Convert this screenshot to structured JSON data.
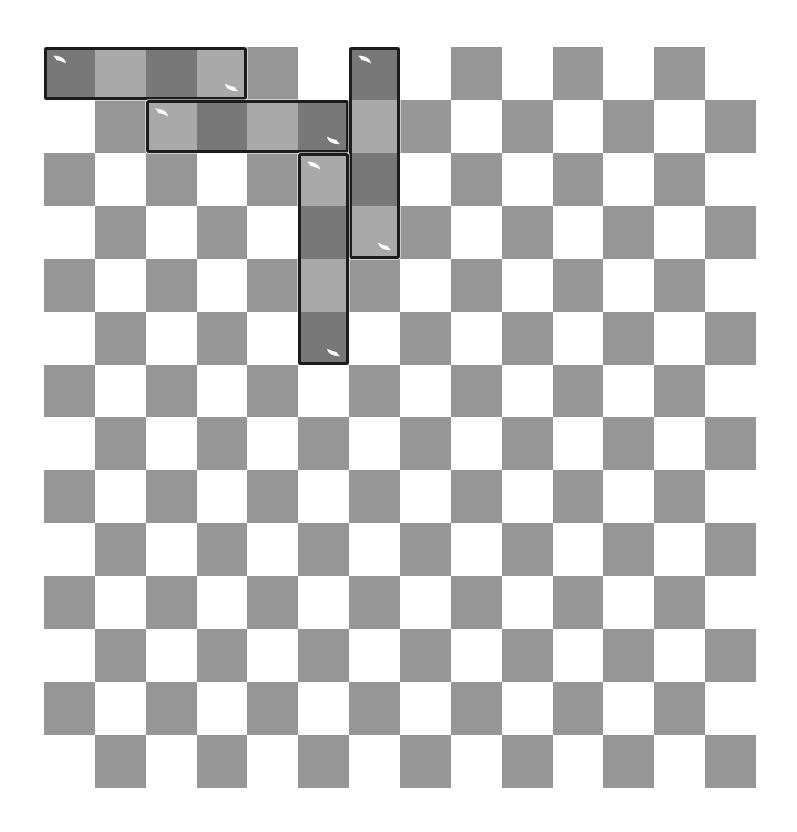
{
  "app": {
    "title": "Checkerboard Tile Puzzle",
    "canvas_width": 797,
    "canvas_height": 832,
    "background_color": "#ffffff"
  },
  "board": {
    "name": "checkerboard-grid",
    "origin_x": 44,
    "origin_y": 47,
    "width": 712,
    "height": 741,
    "columns": 14,
    "rows": 14,
    "cell_width": 50.857,
    "cell_height": 52.928,
    "light_color": "#ffffff",
    "dark_color": "#969696",
    "parity_note": "cell at row 0, col 0 is dark"
  },
  "pieces": {
    "outline_color": "#1c1c1c",
    "outline_width": 3,
    "light_cell_color": "#a9a9a9",
    "dark_cell_color": "#787878",
    "highlight_color": "#ffffff",
    "items": [
      {
        "id": "piece-1",
        "label": "Horizontal 4-tile domino strip",
        "orientation": "horizontal",
        "row": 0,
        "col": 0,
        "length": 4,
        "start_crescent": "top-left",
        "end_crescent": "bottom-right"
      },
      {
        "id": "piece-2",
        "label": "Horizontal 4-tile domino strip",
        "orientation": "horizontal",
        "row": 1,
        "col": 2,
        "length": 4,
        "start_crescent": "top-left",
        "end_crescent": "bottom-right"
      },
      {
        "id": "piece-3",
        "label": "Vertical 4-tile domino strip",
        "orientation": "vertical",
        "row": 0,
        "col": 6,
        "length": 4,
        "start_crescent": "top-left",
        "end_crescent": "bottom-right"
      },
      {
        "id": "piece-4",
        "label": "Vertical 4-tile domino strip",
        "orientation": "vertical",
        "row": 2,
        "col": 5,
        "length": 4,
        "start_crescent": "top-left",
        "end_crescent": "bottom-right"
      }
    ]
  }
}
